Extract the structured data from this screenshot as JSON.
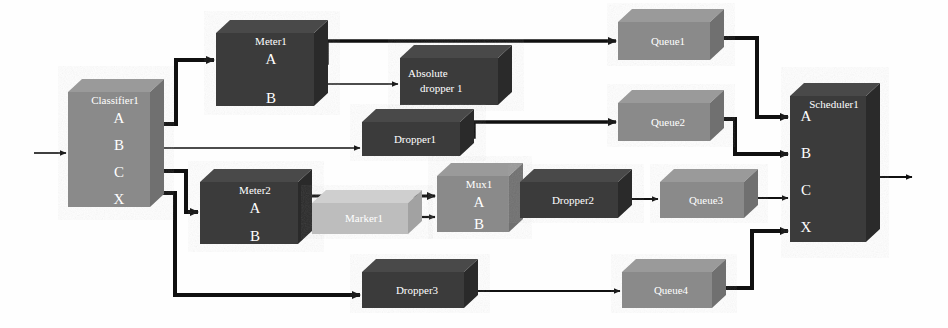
{
  "diagram": {
    "type": "block-flow-diagram",
    "background": "#fefefe",
    "palette": {
      "dark_block_top": "#4a4a4a",
      "dark_block_front": "#3a3a3a",
      "dark_block_side": "#2b2b2b",
      "mid_block_top": "#9a9a9a",
      "mid_block_front": "#8a8a8a",
      "mid_block_side": "#6f6f6f",
      "light_block_top": "#cfcfcf",
      "light_block_front": "#bdbdbd",
      "light_block_side": "#a2a2a2",
      "wire": "#101010",
      "label_text": "#ffffff"
    },
    "blocks": [
      {
        "id": "classifier1",
        "label": "Classifier1",
        "shade": "mid",
        "ports": [
          "A",
          "B",
          "C",
          "X"
        ],
        "x": 68,
        "y": 92,
        "w": 82,
        "h": 115
      },
      {
        "id": "meter1",
        "label": "Meter1",
        "shade": "dark",
        "ports": [
          "A",
          "B"
        ],
        "x": 216,
        "y": 33,
        "w": 98,
        "h": 73
      },
      {
        "id": "absolute_dropper1",
        "label": "Absolute dropper 1",
        "shade": "dark",
        "ports": [],
        "x": 400,
        "y": 58,
        "w": 98,
        "h": 47
      },
      {
        "id": "queue1",
        "label": "Queue1",
        "shade": "mid",
        "ports": [],
        "x": 618,
        "y": 22,
        "w": 92,
        "h": 38
      },
      {
        "id": "dropper1",
        "label": "Dropper1",
        "shade": "dark",
        "ports": [],
        "x": 362,
        "y": 122,
        "w": 98,
        "h": 34
      },
      {
        "id": "queue2",
        "label": "Queue2",
        "shade": "mid",
        "ports": [],
        "x": 618,
        "y": 103,
        "w": 92,
        "h": 38
      },
      {
        "id": "meter2",
        "label": "Meter2",
        "shade": "dark",
        "ports": [
          "A",
          "B"
        ],
        "x": 200,
        "y": 182,
        "w": 98,
        "h": 62
      },
      {
        "id": "marker1",
        "label": "Marker1",
        "shade": "light",
        "ports": [],
        "x": 312,
        "y": 203,
        "w": 96,
        "h": 31
      },
      {
        "id": "mux1",
        "label": "Mux1",
        "shade": "mid",
        "ports": [
          "A",
          "B"
        ],
        "x": 437,
        "y": 176,
        "w": 72,
        "h": 56
      },
      {
        "id": "dropper2",
        "label": "Dropper2",
        "shade": "dark",
        "ports": [],
        "x": 520,
        "y": 182,
        "w": 98,
        "h": 36
      },
      {
        "id": "queue3",
        "label": "Queue3",
        "shade": "mid",
        "ports": [],
        "x": 660,
        "y": 182,
        "w": 84,
        "h": 36
      },
      {
        "id": "dropper3",
        "label": "Dropper3",
        "shade": "dark",
        "ports": [],
        "x": 362,
        "y": 272,
        "w": 102,
        "h": 36
      },
      {
        "id": "queue4",
        "label": "Queue4",
        "shade": "mid",
        "ports": [],
        "x": 622,
        "y": 272,
        "w": 90,
        "h": 36
      },
      {
        "id": "scheduler1",
        "label": "Scheduler1",
        "shade": "dark",
        "ports": [
          "A",
          "B",
          "C",
          "X"
        ],
        "x": 790,
        "y": 96,
        "w": 76,
        "h": 146
      }
    ],
    "external_ports": [
      {
        "id": "input-arrow",
        "name": "diagram-input",
        "x": 34,
        "y": 153
      },
      {
        "id": "output-arrow",
        "name": "diagram-output",
        "x": 878,
        "y": 177
      }
    ],
    "connections": [
      {
        "from": "input",
        "to": "classifier1",
        "label": "ingress"
      },
      {
        "from": "classifier1.A",
        "to": "meter1",
        "label": "A to Meter1"
      },
      {
        "from": "classifier1.B",
        "to": "dropper1",
        "label": "B to Dropper1"
      },
      {
        "from": "classifier1.C",
        "to": "meter2",
        "label": "C to Meter2"
      },
      {
        "from": "classifier1.X",
        "to": "dropper3",
        "label": "X to Dropper3"
      },
      {
        "from": "meter1.A",
        "to": "queue1",
        "label": "Meter1 A to Queue1"
      },
      {
        "from": "meter1.B",
        "to": "absolute_dropper1",
        "label": "Meter1 B to Absolute dropper 1"
      },
      {
        "from": "dropper1",
        "to": "queue2",
        "label": "Dropper1 to Queue2"
      },
      {
        "from": "meter2.A",
        "to": "mux1.A",
        "label": "Meter2 A to Mux1 A"
      },
      {
        "from": "meter2.B",
        "to": "marker1",
        "label": "Meter2 B to Marker1"
      },
      {
        "from": "marker1",
        "to": "mux1.B",
        "label": "Marker1 to Mux1 B"
      },
      {
        "from": "mux1",
        "to": "dropper2",
        "label": "Mux1 to Dropper2"
      },
      {
        "from": "dropper2",
        "to": "queue3",
        "label": "Dropper2 to Queue3"
      },
      {
        "from": "dropper3",
        "to": "queue4",
        "label": "Dropper3 to Queue4"
      },
      {
        "from": "queue1",
        "to": "scheduler1.A",
        "label": "Queue1 to Scheduler1 A"
      },
      {
        "from": "queue2",
        "to": "scheduler1.B",
        "label": "Queue2 to Scheduler1 B"
      },
      {
        "from": "queue3",
        "to": "scheduler1.C",
        "label": "Queue3 to Scheduler1 C"
      },
      {
        "from": "queue4",
        "to": "scheduler1.X",
        "label": "Queue4 to Scheduler1 X"
      },
      {
        "from": "scheduler1",
        "to": "output",
        "label": "egress"
      }
    ]
  }
}
